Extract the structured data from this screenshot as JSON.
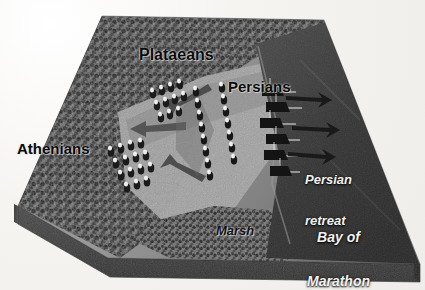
{
  "figure": {
    "type": "3d-relief-battle-map",
    "palette": {
      "paper": "#f4f2ef",
      "terrain_highland": "#4a4a4a",
      "terrain_plain": "#8c8c8c",
      "bay_water": "#3a3a3a",
      "slab_base": "#3c3c3c",
      "label_dark": "#0a0a0a",
      "label_light": "#f2f2f2"
    }
  },
  "labels": {
    "plataeans": "Plataeans",
    "persians": "Persians",
    "athenians": "Athenians",
    "persian_retreat_line1": "Persian",
    "persian_retreat_line2": "retreat",
    "bay_line1": "Bay of",
    "bay_line2": "Marathon",
    "marsh": "Marsh"
  },
  "regions": [
    {
      "name": "highland-forest",
      "tone": "dark",
      "position": "left-and-top"
    },
    {
      "name": "coastal-plain",
      "tone": "mid",
      "position": "center"
    },
    {
      "name": "bay-of-marathon",
      "tone": "dark",
      "position": "right"
    },
    {
      "name": "marsh",
      "tone": "dark-mottled",
      "position": "bottom-center"
    },
    {
      "name": "slab-base",
      "tone": "dark",
      "position": "bottom-edge"
    }
  ],
  "forces": [
    {
      "name": "athenian-wing",
      "marker_count": 14,
      "position": "lower-left-of-plain"
    },
    {
      "name": "plataean-wing",
      "marker_count": 12,
      "position": "upper-center-of-plain"
    },
    {
      "name": "persian-center-column-1",
      "marker_count": 11,
      "position": "center"
    },
    {
      "name": "persian-center-column-2",
      "marker_count": 11,
      "position": "center-right"
    },
    {
      "name": "persian-ships",
      "marker_count": 6,
      "position": "bay-shoreline"
    }
  ],
  "arrows": [
    {
      "name": "athenian-flank-arrow",
      "direction": "left"
    },
    {
      "name": "greek-envelopment-arrow-upper",
      "direction": "left-down"
    },
    {
      "name": "greek-envelopment-arrow-lower",
      "direction": "left-up"
    },
    {
      "name": "persian-retreat-arrow-1",
      "direction": "right"
    },
    {
      "name": "persian-retreat-arrow-2",
      "direction": "right"
    },
    {
      "name": "persian-retreat-arrow-3",
      "direction": "right"
    }
  ]
}
